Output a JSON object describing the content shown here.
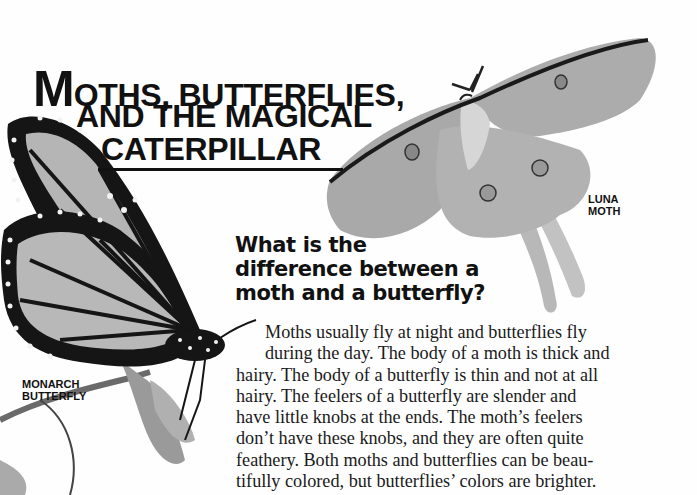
{
  "title": {
    "line1_initial": "M",
    "line1_rest": "OTHS, BUTTERFLIES,",
    "line2": "AND THE MAGICAL",
    "line3": "CATERPILLAR"
  },
  "captions": {
    "luna": [
      "LUNA",
      "MOTH"
    ],
    "monarch": [
      "MONARCH",
      "BUTTERFLY"
    ]
  },
  "question": {
    "lines": [
      "What is the",
      "difference between a",
      "moth and a butterfly?"
    ]
  },
  "body": {
    "lines": [
      "Moths usually fly at night and butterflies fly",
      "during the day. The body of a moth is thick and",
      "hairy. The body of a butterfly is thin and not at all",
      "hairy. The feelers of a butterfly are slender and",
      "have little knobs at the ends. The moth’s feelers",
      "don’t have these knobs, and they are often quite",
      "feathery. Both moths and butterflies can be beau-",
      "tifully colored, but butterflies’ colors are brighter."
    ]
  },
  "images": {
    "luna_moth": "luna-moth-illustration",
    "monarch_butterfly": "monarch-butterfly-illustration"
  },
  "colors": {
    "text": "#111111",
    "moth_wing": "#a8a8a8",
    "moth_edge": "#1a1a1a",
    "butterfly_cell": "#b5b5b5",
    "butterfly_vein": "#151515"
  }
}
